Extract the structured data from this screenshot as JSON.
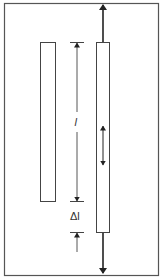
{
  "diagram": {
    "title": "",
    "labels": {
      "length": "l",
      "elongation": "Δl"
    },
    "colors": {
      "background": "#ffffff",
      "line": "#444444",
      "arrow": "#222222"
    },
    "elements": [
      {
        "id": "original-bar",
        "description": "unstressed bar"
      },
      {
        "id": "stretched-bar",
        "description": "bar under tensile force"
      },
      {
        "id": "force-arrow-up",
        "description": "tensile force upward"
      },
      {
        "id": "force-arrow-down",
        "description": "tensile force downward"
      },
      {
        "id": "strain-arrow",
        "description": "internal double arrow"
      }
    ]
  }
}
